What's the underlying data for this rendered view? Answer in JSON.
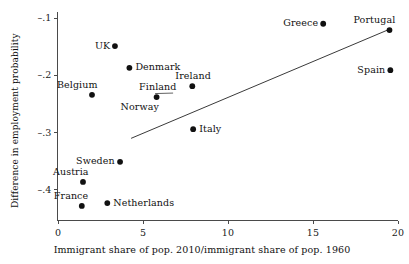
{
  "chart_data": {
    "type": "scatter",
    "title": "",
    "xlabel": "Immigrant share of pop. 2010/immigrant share of pop. 1960",
    "ylabel": "Difference in employment probability",
    "xlim": [
      -0.5,
      20.8
    ],
    "ylim": [
      -0.445,
      -0.088
    ],
    "xticks": [
      0,
      5,
      10,
      15,
      20
    ],
    "xtick_labels": [
      "0",
      "5",
      "10",
      "15",
      "20"
    ],
    "yticks": [
      -0.1,
      -0.2,
      -0.3,
      -0.4
    ],
    "ytick_labels": [
      "–.1",
      "–.2",
      "–.3",
      "–.4"
    ],
    "grid": false,
    "legend": "none",
    "points": [
      {
        "label": "UK",
        "x": 3.35,
        "y": -0.149,
        "label_pos": "left"
      },
      {
        "label": "Denmark",
        "x": 4.2,
        "y": -0.187,
        "label_pos": "right"
      },
      {
        "label": "Belgium",
        "x": 2.0,
        "y": -0.234,
        "label_pos": "above-left"
      },
      {
        "label": "Finland",
        "x": 5.8,
        "y": -0.238,
        "label_pos": "above",
        "leader": true
      },
      {
        "label": "Norway",
        "x": 5.8,
        "y": -0.238,
        "label_pos": "below-left",
        "shared_point": true
      },
      {
        "label": "Ireland",
        "x": 7.9,
        "y": -0.219,
        "label_pos": "above"
      },
      {
        "label": "Italy",
        "x": 7.95,
        "y": -0.294,
        "label_pos": "right"
      },
      {
        "label": "Greece",
        "x": 15.6,
        "y": -0.11,
        "label_pos": "left"
      },
      {
        "label": "Portugal",
        "x": 19.5,
        "y": -0.121,
        "label_pos": "above-left"
      },
      {
        "label": "Spain",
        "x": 19.55,
        "y": -0.191,
        "label_pos": "left"
      },
      {
        "label": "Sweden",
        "x": 3.65,
        "y": -0.351,
        "label_pos": "left"
      },
      {
        "label": "Austria",
        "x": 1.47,
        "y": -0.386,
        "label_pos": "above-left"
      },
      {
        "label": "France",
        "x": 1.4,
        "y": -0.428,
        "label_pos": "above-left"
      },
      {
        "label": "Netherlands",
        "x": 2.9,
        "y": -0.423,
        "label_pos": "right"
      }
    ],
    "trend_line": {
      "x0": 4.3,
      "y0": -0.31,
      "x1": 19.55,
      "y1": -0.119
    },
    "colors": {
      "point": "#111111",
      "line": "#3a3a3a",
      "axis": "#4a4a4a",
      "text": "#111111",
      "background": "#ffffff"
    }
  }
}
